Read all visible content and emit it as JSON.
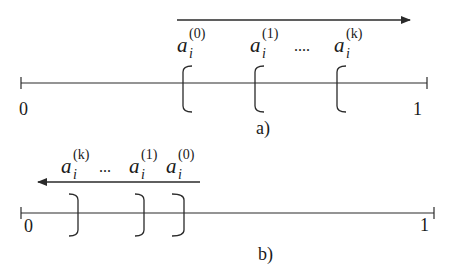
{
  "diagram": {
    "colors": {
      "stroke": "#2a2a2a",
      "text": "#1a1a1a",
      "background": "#ffffff"
    },
    "panels": [
      {
        "id": "a",
        "caption": "a)",
        "arrow_direction": "right",
        "axis": {
          "start_label": "0",
          "end_label": "1"
        },
        "bracket_type": "left",
        "labels": [
          {
            "base": "a",
            "sub": "i",
            "sup": "(0)"
          },
          {
            "base": "a",
            "sub": "i",
            "sup": "(1)"
          },
          {
            "ellipsis": "...."
          },
          {
            "base": "a",
            "sub": "i",
            "sup": "(k)"
          }
        ]
      },
      {
        "id": "b",
        "caption": "b)",
        "arrow_direction": "left",
        "axis": {
          "start_label": "0",
          "end_label": "1"
        },
        "bracket_type": "right",
        "labels": [
          {
            "base": "a",
            "sub": "i",
            "sup": "(k)"
          },
          {
            "ellipsis": "..."
          },
          {
            "base": "a",
            "sub": "i",
            "sup": "(1)"
          },
          {
            "base": "a",
            "sub": "i",
            "sup": "(0)"
          }
        ]
      }
    ]
  }
}
